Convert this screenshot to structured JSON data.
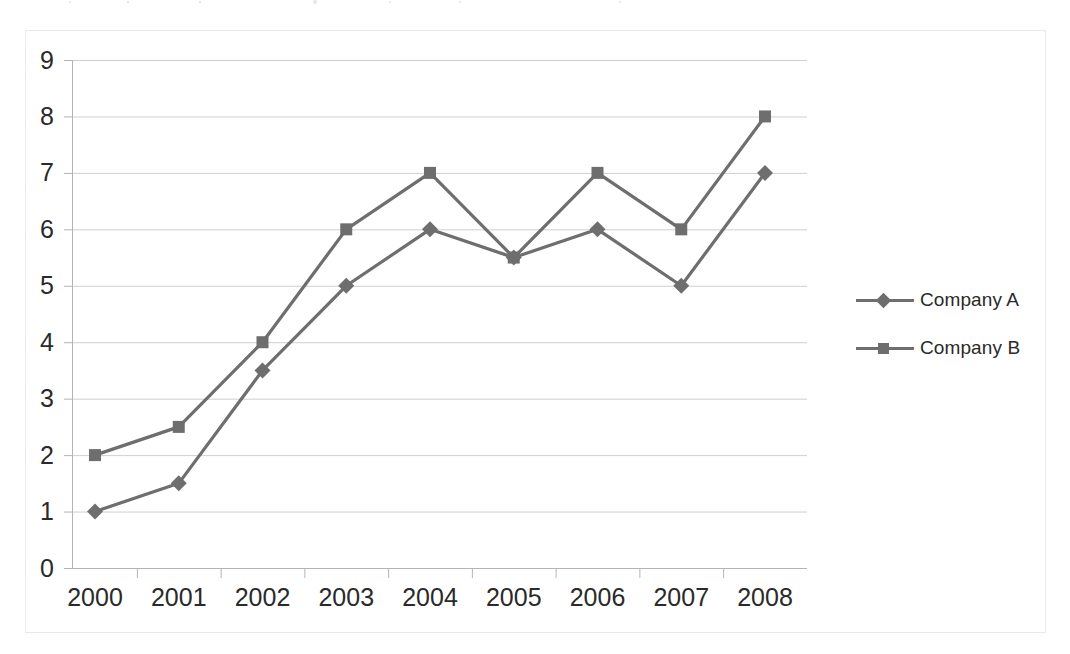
{
  "figure": {
    "name": "line-chart-company-comparison",
    "background_color": "#ffffff",
    "border_color": "#d2d2d2",
    "gridline_color": "#cfcfcf",
    "axis_color": "#b4b4b4",
    "series_color": "#6e6e6e",
    "tick_label_color": "#2a2a2a"
  },
  "chart_data": {
    "type": "line",
    "title": "",
    "subtitle": "",
    "xlabel": "",
    "ylabel": "",
    "categories": [
      "2000",
      "2001",
      "2002",
      "2003",
      "2004",
      "2005",
      "2006",
      "2007",
      "2008"
    ],
    "x": [
      2000,
      2001,
      2002,
      2003,
      2004,
      2005,
      2006,
      2007,
      2008
    ],
    "series": [
      {
        "name": "Company A",
        "marker": "diamond",
        "color": "#6e6e6e",
        "values": [
          1.0,
          1.5,
          3.5,
          5.0,
          6.0,
          5.5,
          6.0,
          5.0,
          7.0
        ]
      },
      {
        "name": "Company B",
        "marker": "square",
        "color": "#6e6e6e",
        "values": [
          2.0,
          2.5,
          4.0,
          6.0,
          7.0,
          5.5,
          7.0,
          6.0,
          8.0
        ]
      }
    ],
    "ylim": [
      0,
      9
    ],
    "yticks": [
      0,
      1,
      2,
      3,
      4,
      5,
      6,
      7,
      8,
      9
    ],
    "ytick_labels": [
      "0",
      "1",
      "2",
      "3",
      "4",
      "5",
      "6",
      "7",
      "8",
      "9"
    ],
    "xtick_labels": [
      "2000",
      "2001",
      "2002",
      "2003",
      "2004",
      "2005",
      "2006",
      "2007",
      "2008"
    ],
    "grid": true,
    "grid_axis": "y",
    "legend_position": "right"
  },
  "legend": {
    "entries": [
      {
        "label": "Company A",
        "marker": "diamond"
      },
      {
        "label": "Company B",
        "marker": "square"
      }
    ]
  }
}
